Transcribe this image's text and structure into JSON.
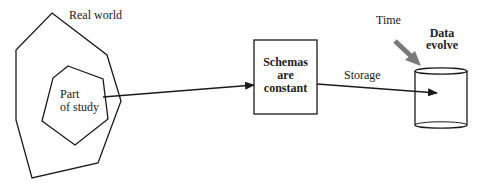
{
  "diagram": {
    "real_world": {
      "label": "Real world"
    },
    "part_of_study": {
      "line1": "Part",
      "line2": "of study"
    },
    "schemas_box": {
      "line1": "Schemas",
      "line2": "are",
      "line3": "constant"
    },
    "storage": {
      "label": "Storage"
    },
    "time": {
      "label": "Time"
    },
    "data_store": {
      "line1": "Data",
      "line2": "evolve"
    },
    "colors": {
      "stroke": "#1a1a1a",
      "time_arrow": "#7a7a7a",
      "background": "#ffffff"
    }
  }
}
